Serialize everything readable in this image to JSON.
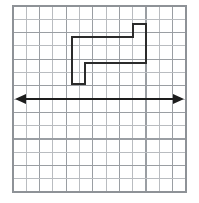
{
  "figure": {
    "background_color": "#ffffff",
    "width": 199,
    "height": 203
  },
  "grid": {
    "name": "graph-paper-grid",
    "columns": 13,
    "rows": 14,
    "cell_size_px": 13.3,
    "origin_x_px": 13,
    "origin_y_px": 6,
    "right_px": 186,
    "bottom_px": 192,
    "minor_line_color": "#b9bcc0",
    "major_line_color": "#9a9ea3",
    "border_color": "#8e9297",
    "show_grid": true
  },
  "shape": {
    "name": "z-shaped-polygon",
    "label": "Z-shaped step polygon",
    "stroke_color": "#2b2b2b",
    "stroke_width_px": 2,
    "fill": "none",
    "closed": true,
    "vertices_px": [
      [
        72,
        37
      ],
      [
        133,
        37
      ],
      [
        133,
        24
      ],
      [
        146,
        24
      ],
      [
        146,
        63
      ],
      [
        85,
        63
      ],
      [
        85,
        84
      ],
      [
        72,
        84
      ]
    ],
    "vertices_grid": [
      [
        4.4,
        2.3
      ],
      [
        9.0,
        2.3
      ],
      [
        9.0,
        1.4
      ],
      [
        10.0,
        1.4
      ],
      [
        10.0,
        4.3
      ],
      [
        5.4,
        4.3
      ],
      [
        5.4,
        5.9
      ],
      [
        4.4,
        5.9
      ]
    ],
    "vertex_count": 8
  },
  "axis": {
    "name": "horizontal-double-arrow-line",
    "label": "Line of reflection",
    "orientation": "horizontal",
    "y_px": 99,
    "x_start_px": 15,
    "x_end_px": 184,
    "color": "#1d1d1d",
    "stroke_width_px": 1.8,
    "arrowhead_left": true,
    "arrowhead_right": true,
    "arrowhead_length_px": 11,
    "arrowhead_half_width_px": 5
  }
}
